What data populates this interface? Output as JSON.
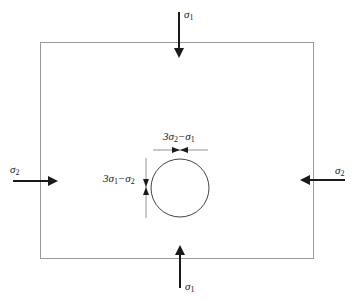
{
  "diagram": {
    "type": "stress-around-circular-hole",
    "plate": {
      "x": 40,
      "y": 42,
      "width": 274,
      "height": 217,
      "stroke": "#999999"
    },
    "hole": {
      "cx": 180,
      "cy": 188,
      "r": 29,
      "stroke": "#444444"
    },
    "loads": {
      "top": {
        "symbol": "σ",
        "sub": "1",
        "direction": "down"
      },
      "bottom": {
        "symbol": "σ",
        "sub": "1",
        "direction": "up"
      },
      "left": {
        "symbol": "σ",
        "sub": "2",
        "direction": "right"
      },
      "right": {
        "symbol": "σ",
        "sub": "2",
        "direction": "left"
      }
    },
    "annotations": {
      "top_of_hole": {
        "a": "3σ",
        "a_sub": "2",
        "b": "−σ",
        "b_sub": "1"
      },
      "side_of_hole": {
        "a": "3σ",
        "a_sub": "1",
        "b": "−σ",
        "b_sub": "2"
      }
    },
    "arrow_color": "#1a1a1a"
  }
}
